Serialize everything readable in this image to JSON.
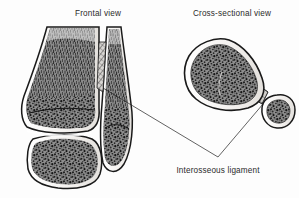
{
  "figure": {
    "type": "anatomical-diagram",
    "background_color": "#fdfdfd",
    "ink_color": "#1c1c1c",
    "bone_fill_color": "#6f6f6f",
    "cortex_color": "#f2f0ee"
  },
  "panels": {
    "left": {
      "title": "Frontal view",
      "title_x": 98,
      "title_y": 16,
      "structures": [
        "tibia",
        "fibula",
        "talus",
        "interosseous-ligament-hatching"
      ]
    },
    "right": {
      "title": "Cross-sectional view",
      "title_x": 232,
      "title_y": 16,
      "structures": [
        "tibia-cross-section",
        "fibula-cross-section",
        "interosseous-ligament-band"
      ]
    }
  },
  "annotation": {
    "label": "Interosseous ligament",
    "label_x": 218,
    "label_y": 173,
    "leader_apex_x": 218,
    "leader_apex_y": 157,
    "leader_target_frontal_x": 103,
    "leader_target_frontal_y": 88,
    "leader_target_cross_x": 263,
    "leader_target_cross_y": 104
  }
}
